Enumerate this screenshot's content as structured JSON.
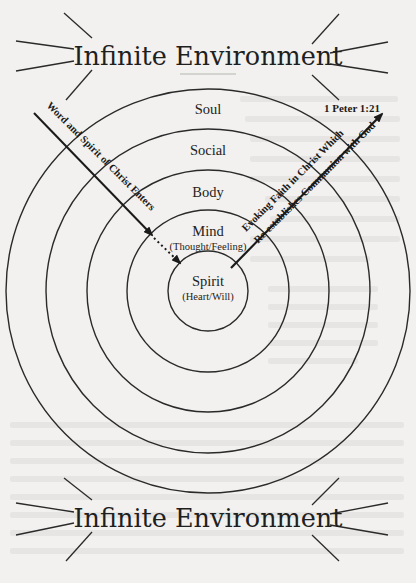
{
  "diagram": {
    "top_title": "Infinite Environment",
    "bottom_title": "Infinite Environment",
    "scripture_reference": "1 Peter 1:21",
    "rings": [
      {
        "label": "Soul",
        "sublabel": ""
      },
      {
        "label": "Social",
        "sublabel": ""
      },
      {
        "label": "Body",
        "sublabel": ""
      },
      {
        "label": "Mind",
        "sublabel": "(Thought/Feeling)"
      },
      {
        "label": "Spirit",
        "sublabel": "(Heart/Will)"
      }
    ],
    "inbound_arrow": {
      "label": "Word and Spirit of Christ Enters",
      "direction": "outer-left to center (dotted final segment)"
    },
    "outbound_arrow": {
      "label_line1": "Evoking Faith in Christ Which",
      "label_line2": "Re-establishes Communion with God",
      "direction": "center to outer-right"
    },
    "colors": {
      "ink": "#2a2a2a",
      "paper": "#f2f1ef",
      "bleed_through": "#e4e3e0"
    }
  }
}
